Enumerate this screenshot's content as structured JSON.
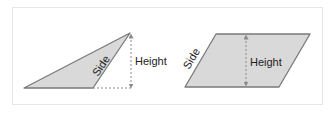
{
  "figures": [
    {
      "shape": "triangle",
      "labels": {
        "side": "Side",
        "height": "Height"
      }
    },
    {
      "shape": "parallelogram",
      "labels": {
        "side": "Side",
        "height": "Height"
      }
    }
  ],
  "colors": {
    "fill": "#d9d9d9",
    "stroke": "#7a7a7a",
    "guide": "#8a8a8a",
    "frame": "#e6e6e6"
  }
}
